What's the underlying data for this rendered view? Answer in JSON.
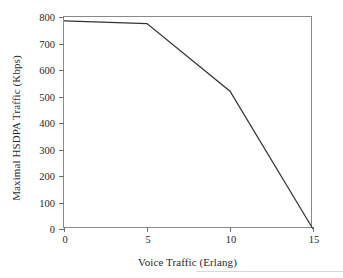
{
  "chart_data": {
    "type": "line",
    "title": "",
    "xlabel": "Voice Traffic (Erlang)",
    "ylabel": "Maximal HSDPA Traffic (Kbps)",
    "xlim": [
      0,
      15
    ],
    "ylim": [
      0,
      800
    ],
    "xticks": [
      0,
      5,
      10,
      15
    ],
    "yticks": [
      0,
      100,
      200,
      300,
      400,
      500,
      600,
      700,
      800
    ],
    "xtick_labels": [
      "0",
      "5",
      "10",
      "15"
    ],
    "ytick_labels": [
      "0",
      "100",
      "200",
      "300",
      "400",
      "500",
      "600",
      "700",
      "800"
    ],
    "grid": false,
    "legend": false,
    "series": [
      {
        "name": "Maximal HSDPA Traffic",
        "color": "#333333",
        "x": [
          0,
          5,
          10,
          15
        ],
        "values": [
          785,
          775,
          520,
          0
        ]
      }
    ]
  }
}
